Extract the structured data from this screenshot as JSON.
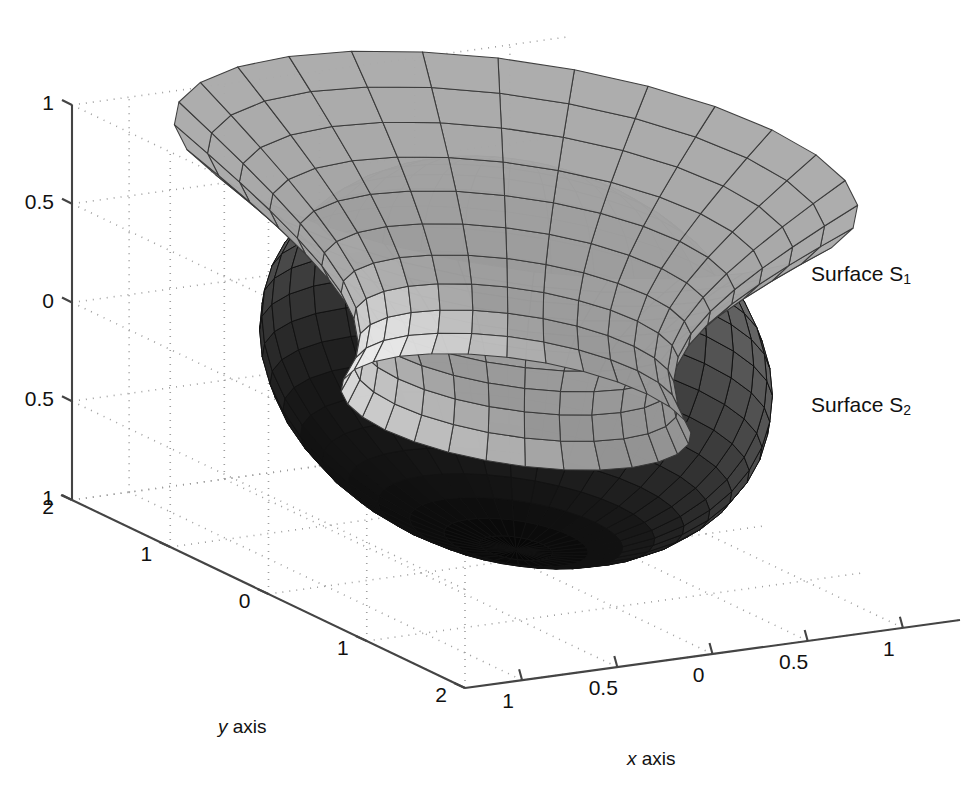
{
  "figure": {
    "kind": "matlab-3d-surface-plot",
    "background": "#ffffff",
    "ink": "#111111"
  },
  "axes": {
    "x": {
      "label_italic": "x",
      "label_rest": " axis",
      "ticks": [
        "1",
        "0.5",
        "0",
        "0.5",
        "1"
      ],
      "true_values": [
        -1,
        -0.5,
        0,
        0.5,
        1
      ],
      "range": [
        -1.3,
        1.3
      ]
    },
    "y": {
      "label_italic": "y",
      "label_rest": " axis",
      "ticks": [
        "2",
        "1",
        "0",
        "1",
        "2"
      ],
      "true_values": [
        -2,
        -1,
        0,
        1,
        2
      ],
      "range": [
        -2,
        2
      ]
    },
    "z": {
      "ticks": [
        "1",
        "0.5",
        "0",
        "0.5",
        "1"
      ],
      "true_values": [
        1,
        0.5,
        0,
        -0.5,
        -1
      ],
      "range": [
        -1,
        1
      ]
    },
    "grid": "dotted",
    "box": "back-walls-and-floor"
  },
  "annotations": [
    {
      "name": "surface-s1-label",
      "text": "Surface S",
      "sub": "1"
    },
    {
      "name": "surface-s2-label",
      "text": "Surface S",
      "sub": "2"
    }
  ],
  "chart_data": {
    "type": "surface3d",
    "title": "",
    "xlabel": "x axis",
    "ylabel": "y axis",
    "zlabel": "",
    "xlim": [
      -1.3,
      1.3
    ],
    "ylim": [
      -2,
      2
    ],
    "zlim": [
      -1,
      1
    ],
    "xticks": [
      -1,
      -0.5,
      0,
      0.5,
      1
    ],
    "yticks": [
      -2,
      -1,
      0,
      1,
      2
    ],
    "zticks": [
      1,
      0.5,
      0,
      -0.5,
      -1
    ],
    "xticklabels": [
      "1",
      "0.5",
      "0",
      "0.5",
      "1"
    ],
    "yticklabels": [
      "2",
      "1",
      "0",
      "1",
      "2"
    ],
    "zticklabels": [
      "1",
      "0.5",
      "0",
      "0.5",
      "1"
    ],
    "grid": true,
    "grid_style": "dotted",
    "legend": "none",
    "view": {
      "azimuth": -37.5,
      "elevation": 24
    },
    "colormap": "gray",
    "series": [
      {
        "name": "Surface S1",
        "shape": "hyperboloid-of-one-sheet",
        "mesh": "wireframe-shaded",
        "shading": "light-gray",
        "face_light": "#d9d9d9",
        "face_dark": "#9a9a9a",
        "edge": "#333333",
        "u_divisions": 28,
        "v_divisions": 10,
        "waist_radius": 0.62,
        "rim_radius": 1.0,
        "z_span": [
          -0.25,
          1.0
        ],
        "annotated_as": "Surface S1"
      },
      {
        "name": "Surface S2",
        "shape": "ellipsoid",
        "mesh": "wireframe-shaded",
        "shading": "dark-gray-to-black",
        "face_light": "#8c8c8c",
        "face_dark": "#0a0a0a",
        "edge": "#1a1a1a",
        "u_divisions": 36,
        "v_divisions": 22,
        "semi_axes": [
          1.0,
          1.75,
          0.95
        ],
        "pole_visible_at": "right",
        "annotated_as": "Surface S2"
      }
    ]
  }
}
